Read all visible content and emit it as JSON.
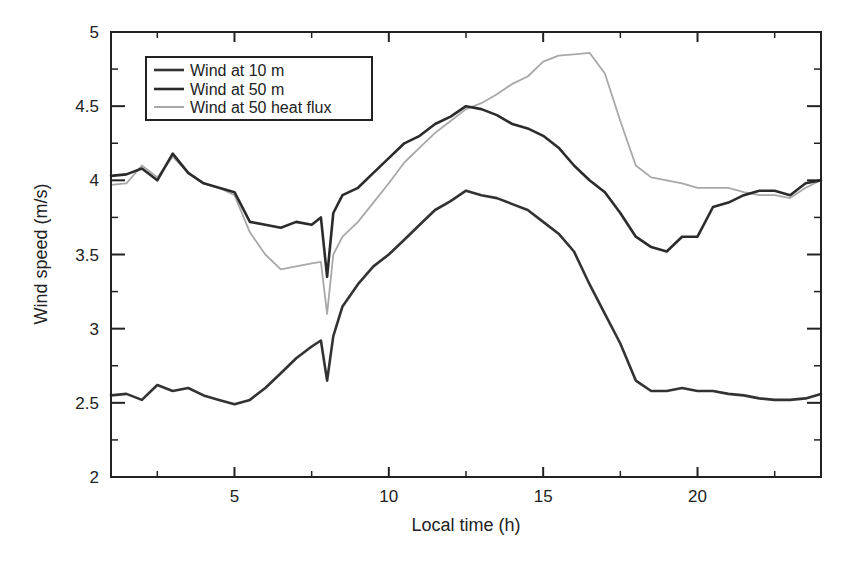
{
  "chart_data": {
    "type": "line",
    "title": "",
    "xlabel": "Local time (h)",
    "ylabel": "Wind speed (m/s)",
    "xlim": [
      1,
      24
    ],
    "ylim": [
      2,
      5
    ],
    "xticks_major": [
      5,
      10,
      15,
      20
    ],
    "xticks_minor": [
      2.5,
      7.5,
      12.5,
      17.5,
      22.5
    ],
    "yticks_major": [
      2,
      2.5,
      3,
      3.5,
      4,
      4.5,
      5
    ],
    "ytick_labels": [
      "2",
      "2.5",
      "3",
      "3.5",
      "4",
      "4.5",
      "5"
    ],
    "xtick_labels": [
      "5",
      "10",
      "15",
      "20"
    ],
    "grid": false,
    "legend_position": "upper-left",
    "x": [
      1,
      1.5,
      2,
      2.5,
      3,
      3.5,
      4,
      4.5,
      5,
      5.5,
      6,
      6.5,
      7,
      7.5,
      7.8,
      8,
      8.2,
      8.5,
      9,
      9.5,
      10,
      10.5,
      11,
      11.5,
      12,
      12.5,
      13,
      13.5,
      14,
      14.5,
      15,
      15.5,
      16,
      16.5,
      17,
      17.5,
      18,
      18.5,
      19,
      19.5,
      20,
      20.5,
      21,
      21.5,
      22,
      22.5,
      23,
      23.5,
      24
    ],
    "series": [
      {
        "name": "Wind at 10 m",
        "color": "#333333",
        "width": 2.6,
        "values": [
          2.55,
          2.56,
          2.52,
          2.62,
          2.58,
          2.6,
          2.55,
          2.52,
          2.49,
          2.52,
          2.6,
          2.7,
          2.8,
          2.88,
          2.92,
          2.65,
          2.95,
          3.15,
          3.3,
          3.42,
          3.5,
          3.6,
          3.7,
          3.8,
          3.86,
          3.93,
          3.9,
          3.88,
          3.84,
          3.8,
          3.72,
          3.64,
          3.52,
          3.3,
          3.1,
          2.9,
          2.65,
          2.58,
          2.58,
          2.6,
          2.58,
          2.58,
          2.56,
          2.55,
          2.53,
          2.52,
          2.52,
          2.53,
          2.56
        ]
      },
      {
        "name": "Wind at 50 m",
        "color": "#2b2b2b",
        "width": 2.6,
        "values": [
          4.03,
          4.04,
          4.08,
          4.0,
          4.18,
          4.05,
          3.98,
          3.95,
          3.92,
          3.72,
          3.7,
          3.68,
          3.72,
          3.7,
          3.75,
          3.35,
          3.78,
          3.9,
          3.95,
          4.05,
          4.15,
          4.25,
          4.3,
          4.38,
          4.43,
          4.5,
          4.48,
          4.44,
          4.38,
          4.35,
          4.3,
          4.22,
          4.1,
          4.0,
          3.92,
          3.78,
          3.62,
          3.55,
          3.52,
          3.62,
          3.62,
          3.82,
          3.85,
          3.9,
          3.93,
          3.93,
          3.9,
          3.98,
          4.0
        ]
      },
      {
        "name": "Wind at 50 heat flux",
        "color": "#a8a8a8",
        "width": 1.8,
        "values": [
          3.97,
          3.98,
          4.1,
          4.02,
          4.16,
          4.05,
          3.98,
          3.95,
          3.9,
          3.65,
          3.5,
          3.4,
          3.42,
          3.44,
          3.45,
          3.1,
          3.5,
          3.62,
          3.72,
          3.85,
          3.98,
          4.12,
          4.22,
          4.32,
          4.4,
          4.48,
          4.52,
          4.58,
          4.65,
          4.7,
          4.8,
          4.84,
          4.85,
          4.86,
          4.72,
          4.4,
          4.1,
          4.02,
          4.0,
          3.98,
          3.95,
          3.95,
          3.95,
          3.92,
          3.9,
          3.9,
          3.88,
          3.95,
          4.0
        ]
      }
    ]
  },
  "legend": {
    "items": [
      {
        "label": "Wind at 10 m"
      },
      {
        "label": "Wind at 50 m"
      },
      {
        "label": "Wind at 50 heat flux"
      }
    ]
  }
}
